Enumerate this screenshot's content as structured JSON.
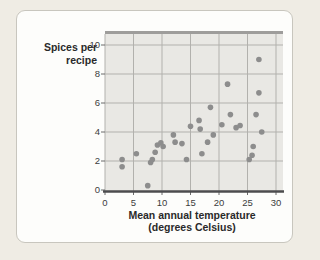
{
  "card": {
    "background": "#fdfdfb",
    "border_color": "#c8c6be"
  },
  "chart_data": {
    "type": "scatter",
    "title": "",
    "ylabel_line1": "Spices per",
    "ylabel_line2": "recipe",
    "xlabel_line1": "Mean annual temperature",
    "xlabel_line2": "(degrees Celsius)",
    "xlim": [
      0,
      30
    ],
    "ylim": [
      0,
      10
    ],
    "xticks": [
      0,
      5,
      10,
      15,
      20,
      25,
      30
    ],
    "yticks": [
      0,
      2,
      4,
      6,
      8,
      10
    ],
    "grid": true,
    "legend": "none",
    "colors": {
      "plot_background": "#e9e8e4",
      "gridline": "#b2b1ad",
      "top_border": "#9e9d9b",
      "axis_line": "#4c4c4e",
      "tick_mark": "#6a6a6a",
      "point": "#8d8d8d"
    },
    "points": [
      [
        3,
        2.1
      ],
      [
        3,
        1.6
      ],
      [
        5.5,
        2.5
      ],
      [
        7.5,
        0.3
      ],
      [
        8,
        1.9
      ],
      [
        8.3,
        2.1
      ],
      [
        8.8,
        2.6
      ],
      [
        9.2,
        3.1
      ],
      [
        9.8,
        3.25
      ],
      [
        10.2,
        3.0
      ],
      [
        12,
        3.8
      ],
      [
        12.3,
        3.3
      ],
      [
        13.5,
        3.2
      ],
      [
        14.3,
        2.1
      ],
      [
        15,
        4.4
      ],
      [
        16.5,
        4.8
      ],
      [
        16.7,
        4.2
      ],
      [
        17,
        2.5
      ],
      [
        18,
        3.3
      ],
      [
        18.5,
        5.7
      ],
      [
        19,
        3.8
      ],
      [
        20.5,
        4.5
      ],
      [
        21.5,
        7.3
      ],
      [
        22,
        5.2
      ],
      [
        23,
        4.3
      ],
      [
        23.7,
        4.45
      ],
      [
        25.3,
        2.1
      ],
      [
        25.8,
        2.4
      ],
      [
        26,
        3.0
      ],
      [
        26.5,
        5.2
      ],
      [
        27,
        9.0
      ],
      [
        27,
        6.7
      ],
      [
        27.5,
        4.0
      ]
    ]
  }
}
